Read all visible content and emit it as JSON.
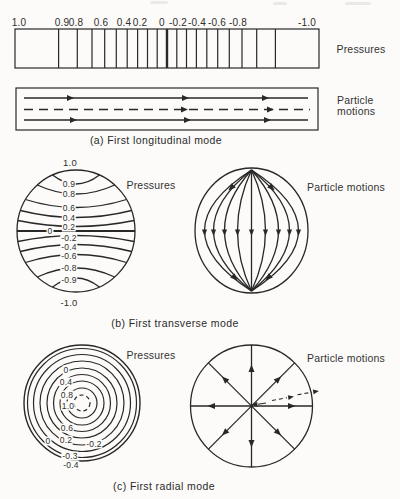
{
  "figure": {
    "panel_a": {
      "caption": "(a) First longitudinal mode",
      "pressures_label": "Pressures",
      "particle_motions_label": "Particle motions",
      "scale_labels": [
        "1.0",
        "0.9",
        "0.8",
        "0.6",
        "0.4",
        "0.2",
        "0",
        "-0.2",
        "-0.4",
        "-0.6",
        "-0.8",
        "-1.0"
      ]
    },
    "panel_b": {
      "caption": "(b) First transverse mode",
      "pressures_label": "Pressures",
      "particle_motions_label": "Particle motions",
      "top_value": "1.0",
      "bottom_value": "-1.0",
      "zero_value": "0",
      "contours_top": [
        "0.9",
        "0.8",
        "0.6",
        "0.4",
        "0.2"
      ],
      "contours_bottom": [
        "-0.2",
        "-0.4",
        "-0.6",
        "-0.8",
        "-0.9"
      ]
    },
    "panel_c": {
      "caption": "(c) First radial mode",
      "pressures_label": "Pressures",
      "particle_motions_label": "Particle motions",
      "rings_upper": [
        "0",
        "0.4",
        "0.8"
      ],
      "center_value": "1.0",
      "rings_lower": [
        "0.6",
        "0.2"
      ],
      "zero_lower": "0",
      "rings_negative": [
        "-0.2",
        "-0.3",
        "-0.4"
      ]
    }
  }
}
